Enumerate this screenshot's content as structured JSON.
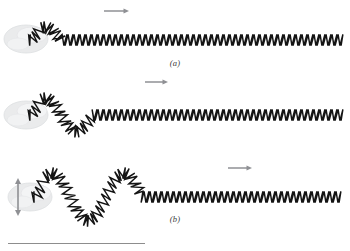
{
  "figure": {
    "background_color": "#ffffff",
    "width": 350,
    "height": 251,
    "coil_color": "#141414",
    "arrow_color": "#8f9094",
    "hand_color": "#e9eaec",
    "rule_color": "#8d8d8d",
    "label_color": "#3a3a3a"
  },
  "panels": [
    {
      "id": "a",
      "label": "(a)",
      "caption_text": "(a)",
      "description": "single upward pulse travelling right along a spring",
      "pulse_count": 1,
      "amplitude": 13,
      "wavelength": 62,
      "arrow": {
        "name": "propagation-arrow",
        "direction": "right",
        "x1": 104,
        "y1": 11,
        "x2": 129,
        "y2": 11
      },
      "hand": {
        "name": "hand",
        "cx": 26,
        "cy": 39
      },
      "spring": {
        "x_start": 30,
        "x_end": 342,
        "baseline_y": 40
      }
    },
    {
      "id": "b",
      "label": "(b)",
      "caption_text": "(b)",
      "description": "one and a half wave cycles travelling right along a spring",
      "pulse_count": 2,
      "amplitude": 17,
      "wavelength": 62,
      "arrow": {
        "name": "propagation-arrow",
        "direction": "right",
        "x1": 145,
        "y1": 82,
        "x2": 168,
        "y2": 82
      },
      "hand": {
        "name": "hand",
        "cx": 26,
        "cy": 115
      },
      "spring": {
        "x_start": 30,
        "x_end": 342,
        "baseline_y": 115
      }
    },
    {
      "id": "c",
      "label": "(c)",
      "caption_text": "(c)",
      "description": "continuous wave of larger amplitude travelling right along a spring; hand oscillates up and down",
      "pulse_count": 3,
      "amplitude": 24,
      "wavelength": 72,
      "arrow": {
        "name": "propagation-arrow",
        "direction": "right",
        "x1": 228,
        "y1": 168,
        "x2": 252,
        "y2": 168
      },
      "oscillation_arrow": {
        "name": "hand-oscillation-arrow",
        "direction": "up-down",
        "x": 18,
        "y_top": 178,
        "y_bottom": 216
      },
      "hand": {
        "name": "hand",
        "cx": 30,
        "cy": 197
      },
      "spring": {
        "x_start": 34,
        "x_end": 342,
        "baseline_y": 197
      }
    }
  ],
  "footer": {
    "rule": {
      "name": "horizontal-rule",
      "x": 8,
      "y": 243,
      "width": 137
    }
  }
}
